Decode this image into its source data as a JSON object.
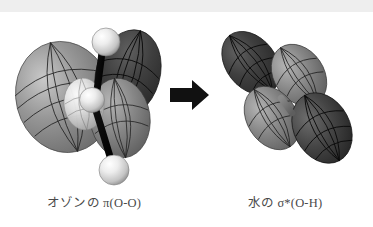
{
  "figure": {
    "title_left": "オゾンの π(O-O)",
    "title_right": "水の σ*(O-H)",
    "left_label_parts": {
      "molecule": "オゾンの",
      "orbital_symbol": "π",
      "orbital_star": "",
      "bond": "(O-O)"
    },
    "right_label_parts": {
      "molecule": "水の",
      "orbital_symbol": "σ",
      "orbital_star": "*",
      "bond": "(O-H)"
    },
    "arrow": {
      "name": "right-arrow",
      "direction": "right",
      "color": "#111111"
    },
    "left_structure": {
      "name": "ozone-pi-orbital",
      "atom_count": 3,
      "atom_color": "#e8e8e8",
      "bond_color": "#0d0d0d",
      "lobe_light_color": "#8e8e8e",
      "lobe_dark_color": "#3a3a3a",
      "mesh_color": "#1a1a1a"
    },
    "right_structure": {
      "name": "water-sigma-star-orbital",
      "lobe_count": 4,
      "lobe_dark_color": "#3d3d3d",
      "lobe_mid_color": "#707070",
      "bond_color": "#6f6f6f",
      "mesh_color": "#141414"
    },
    "background_color": "#ffffff",
    "top_band_color": "#eeeeee"
  }
}
